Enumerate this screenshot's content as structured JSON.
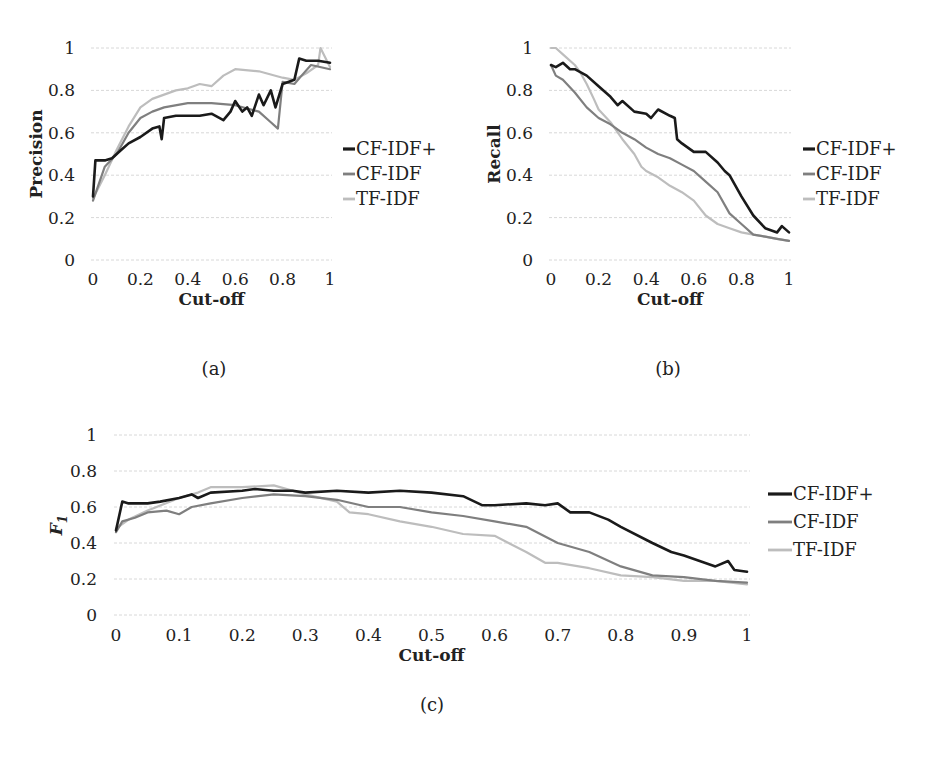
{
  "chart_data": [
    {
      "id": "a",
      "type": "line",
      "caption": "(a)",
      "title": "",
      "xlabel": "Cut-off",
      "ylabel": "Precision",
      "xlim": [
        0,
        1
      ],
      "ylim": [
        0,
        1
      ],
      "xticks": [
        "0",
        "0.2",
        "0.4",
        "0.6",
        "0.8",
        "1"
      ],
      "yticks": [
        "0",
        "0.2",
        "0.4",
        "0.6",
        "0.8",
        "1"
      ],
      "grid": true,
      "legend_position": "right",
      "series": [
        {
          "name": "CF-IDF+",
          "color": "#1a1a1a",
          "width": 2.6,
          "x": [
            0,
            0.01,
            0.05,
            0.08,
            0.1,
            0.12,
            0.15,
            0.2,
            0.25,
            0.28,
            0.29,
            0.3,
            0.35,
            0.4,
            0.45,
            0.5,
            0.55,
            0.58,
            0.6,
            0.63,
            0.65,
            0.67,
            0.7,
            0.72,
            0.75,
            0.77,
            0.8,
            0.85,
            0.87,
            0.9,
            0.95,
            1
          ],
          "values": [
            0.3,
            0.47,
            0.47,
            0.48,
            0.5,
            0.52,
            0.55,
            0.58,
            0.62,
            0.63,
            0.57,
            0.67,
            0.68,
            0.68,
            0.68,
            0.69,
            0.66,
            0.7,
            0.75,
            0.7,
            0.72,
            0.68,
            0.78,
            0.73,
            0.8,
            0.72,
            0.83,
            0.85,
            0.95,
            0.94,
            0.94,
            0.93
          ]
        },
        {
          "name": "CF-IDF",
          "color": "#7f7f7f",
          "width": 2.2,
          "x": [
            0,
            0.05,
            0.1,
            0.15,
            0.2,
            0.25,
            0.3,
            0.4,
            0.5,
            0.6,
            0.7,
            0.75,
            0.78,
            0.8,
            0.85,
            0.88,
            0.92,
            1
          ],
          "values": [
            0.28,
            0.44,
            0.5,
            0.6,
            0.67,
            0.7,
            0.72,
            0.74,
            0.74,
            0.73,
            0.7,
            0.65,
            0.62,
            0.84,
            0.83,
            0.87,
            0.92,
            0.9
          ]
        },
        {
          "name": "TF-IDF",
          "color": "#bdbdbd",
          "width": 2.2,
          "x": [
            0,
            0.05,
            0.1,
            0.15,
            0.2,
            0.25,
            0.3,
            0.35,
            0.4,
            0.45,
            0.5,
            0.55,
            0.6,
            0.7,
            0.8,
            0.85,
            0.9,
            0.95,
            0.96,
            1
          ],
          "values": [
            0.29,
            0.4,
            0.52,
            0.63,
            0.72,
            0.76,
            0.78,
            0.8,
            0.81,
            0.83,
            0.82,
            0.87,
            0.9,
            0.89,
            0.86,
            0.85,
            0.88,
            0.92,
            1.0,
            0.91
          ]
        }
      ]
    },
    {
      "id": "b",
      "type": "line",
      "caption": "(b)",
      "title": "",
      "xlabel": "Cut-off",
      "ylabel": "Recall",
      "xlim": [
        0,
        1
      ],
      "ylim": [
        0,
        1
      ],
      "xticks": [
        "0",
        "0.2",
        "0.4",
        "0.6",
        "0.8",
        "1"
      ],
      "yticks": [
        "0",
        "0.2",
        "0.4",
        "0.6",
        "0.8",
        "1"
      ],
      "grid": true,
      "legend_position": "right",
      "series": [
        {
          "name": "CF-IDF+",
          "color": "#1a1a1a",
          "width": 2.6,
          "x": [
            0,
            0.02,
            0.05,
            0.08,
            0.1,
            0.15,
            0.2,
            0.25,
            0.28,
            0.3,
            0.35,
            0.4,
            0.42,
            0.45,
            0.5,
            0.52,
            0.53,
            0.55,
            0.6,
            0.65,
            0.7,
            0.73,
            0.75,
            0.8,
            0.85,
            0.9,
            0.95,
            0.97,
            1
          ],
          "values": [
            0.92,
            0.91,
            0.93,
            0.9,
            0.9,
            0.87,
            0.82,
            0.77,
            0.73,
            0.75,
            0.7,
            0.69,
            0.67,
            0.71,
            0.68,
            0.67,
            0.57,
            0.55,
            0.51,
            0.51,
            0.46,
            0.42,
            0.4,
            0.3,
            0.21,
            0.15,
            0.13,
            0.16,
            0.13
          ]
        },
        {
          "name": "CF-IDF",
          "color": "#7f7f7f",
          "width": 2.2,
          "x": [
            0,
            0.02,
            0.05,
            0.1,
            0.15,
            0.2,
            0.25,
            0.3,
            0.35,
            0.4,
            0.45,
            0.5,
            0.55,
            0.6,
            0.65,
            0.7,
            0.75,
            0.8,
            0.85,
            0.9,
            0.95,
            1
          ],
          "values": [
            0.92,
            0.87,
            0.85,
            0.79,
            0.72,
            0.67,
            0.64,
            0.6,
            0.57,
            0.53,
            0.5,
            0.48,
            0.45,
            0.42,
            0.37,
            0.32,
            0.22,
            0.17,
            0.12,
            0.11,
            0.1,
            0.09
          ]
        },
        {
          "name": "TF-IDF",
          "color": "#bdbdbd",
          "width": 2.2,
          "x": [
            0,
            0.02,
            0.05,
            0.1,
            0.12,
            0.15,
            0.18,
            0.2,
            0.25,
            0.3,
            0.35,
            0.38,
            0.4,
            0.45,
            0.5,
            0.55,
            0.6,
            0.65,
            0.7,
            0.75,
            0.8,
            0.85,
            0.9,
            0.95,
            1
          ],
          "values": [
            1.0,
            1.0,
            0.97,
            0.92,
            0.89,
            0.83,
            0.76,
            0.71,
            0.65,
            0.57,
            0.5,
            0.44,
            0.42,
            0.39,
            0.35,
            0.32,
            0.28,
            0.21,
            0.17,
            0.15,
            0.13,
            0.12,
            0.11,
            0.1,
            0.09
          ]
        }
      ]
    },
    {
      "id": "c",
      "type": "line",
      "caption": "(c)",
      "title": "",
      "xlabel": "Cut-off",
      "ylabel": "F1",
      "xlim": [
        0,
        1
      ],
      "ylim": [
        0,
        1
      ],
      "xticks": [
        "0",
        "0.1",
        "0.2",
        "0.3",
        "0.4",
        "0.5",
        "0.6",
        "0.7",
        "0.8",
        "0.9",
        "1"
      ],
      "yticks": [
        "0",
        "0.2",
        "0.4",
        "0.6",
        "0.8",
        "1"
      ],
      "grid": true,
      "legend_position": "right",
      "series": [
        {
          "name": "CF-IDF+",
          "color": "#1a1a1a",
          "width": 2.6,
          "x": [
            0,
            0.01,
            0.02,
            0.05,
            0.07,
            0.1,
            0.12,
            0.13,
            0.15,
            0.2,
            0.22,
            0.25,
            0.28,
            0.3,
            0.35,
            0.4,
            0.45,
            0.5,
            0.55,
            0.58,
            0.6,
            0.65,
            0.68,
            0.7,
            0.72,
            0.75,
            0.78,
            0.8,
            0.85,
            0.88,
            0.9,
            0.95,
            0.97,
            0.98,
            1
          ],
          "values": [
            0.47,
            0.63,
            0.62,
            0.62,
            0.63,
            0.65,
            0.67,
            0.65,
            0.68,
            0.69,
            0.7,
            0.69,
            0.69,
            0.68,
            0.69,
            0.68,
            0.69,
            0.68,
            0.66,
            0.61,
            0.61,
            0.62,
            0.61,
            0.62,
            0.57,
            0.57,
            0.53,
            0.49,
            0.4,
            0.35,
            0.33,
            0.27,
            0.3,
            0.25,
            0.24
          ]
        },
        {
          "name": "CF-IDF",
          "color": "#7f7f7f",
          "width": 2.2,
          "x": [
            0,
            0.01,
            0.03,
            0.05,
            0.08,
            0.1,
            0.12,
            0.15,
            0.2,
            0.25,
            0.3,
            0.35,
            0.4,
            0.45,
            0.5,
            0.55,
            0.6,
            0.65,
            0.7,
            0.75,
            0.8,
            0.85,
            0.9,
            0.95,
            1
          ],
          "values": [
            0.46,
            0.52,
            0.54,
            0.57,
            0.58,
            0.56,
            0.6,
            0.62,
            0.65,
            0.67,
            0.66,
            0.64,
            0.6,
            0.6,
            0.57,
            0.55,
            0.52,
            0.49,
            0.4,
            0.35,
            0.27,
            0.22,
            0.21,
            0.19,
            0.18
          ]
        },
        {
          "name": "TF-IDF",
          "color": "#bdbdbd",
          "width": 2.2,
          "x": [
            0,
            0.02,
            0.05,
            0.1,
            0.13,
            0.15,
            0.2,
            0.25,
            0.3,
            0.35,
            0.37,
            0.4,
            0.45,
            0.5,
            0.55,
            0.6,
            0.65,
            0.68,
            0.7,
            0.75,
            0.8,
            0.85,
            0.9,
            0.95,
            1
          ],
          "values": [
            0.48,
            0.53,
            0.58,
            0.65,
            0.68,
            0.71,
            0.71,
            0.72,
            0.67,
            0.63,
            0.57,
            0.56,
            0.52,
            0.49,
            0.45,
            0.44,
            0.35,
            0.29,
            0.29,
            0.26,
            0.22,
            0.21,
            0.19,
            0.19,
            0.17
          ]
        }
      ]
    }
  ]
}
